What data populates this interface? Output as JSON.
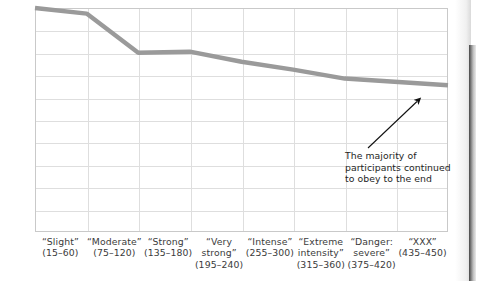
{
  "chart_data": {
    "type": "line",
    "title": "",
    "xlabel": "",
    "ylabel": "",
    "ylim": [
      0,
      100
    ],
    "ytick_values": [
      0,
      10,
      20,
      30,
      40,
      50,
      60,
      70,
      80,
      90,
      100
    ],
    "ytick_labels": [
      "0",
      "10",
      "20",
      "30",
      "40",
      "50",
      "60",
      "70",
      "80",
      "90",
      "100%"
    ],
    "grid": true,
    "legend": "none",
    "categories": [
      "“Slight”\n(15–60)",
      "“Moderate”\n(75–120)",
      "“Strong”\n(135–180)",
      "“Very\nstrong”\n(195–240)",
      "“Intense”\n(255–300)",
      "“Extreme\nintensity”\n(315–360)",
      "“Danger:\nsevere”\n(375–420)",
      "“XXX”\n(435–450)"
    ],
    "values": [
      100,
      97.5,
      80,
      80.5,
      76,
      72.5,
      68.5,
      65.5
    ],
    "series": [
      {
        "name": "Participants continuing",
        "values": [
          100,
          97.5,
          80,
          80.5,
          76,
          72.5,
          68.5,
          65.5
        ],
        "color": "#9a9a9a"
      }
    ],
    "annotations": [
      {
        "text": "The majority of participants continued to obey to the end",
        "lines": [
          "The majority of",
          "participants continued",
          "to obey to the end"
        ],
        "arrow": "points up-right to end of line"
      }
    ]
  },
  "axis": {
    "y": {
      "labels": [
        "100%",
        "90",
        "80",
        "70",
        "60",
        "50",
        "40",
        "30",
        "20",
        "10",
        "0"
      ]
    },
    "x": {
      "labels": [
        {
          "l1": "“Slight”",
          "l2": "(15–60)",
          "l3": ""
        },
        {
          "l1": "“Moderate”",
          "l2": "(75–120)",
          "l3": ""
        },
        {
          "l1": "“Strong”",
          "l2": "(135–180)",
          "l3": ""
        },
        {
          "l1": "“Very",
          "l2": "strong”",
          "l3": "(195–240)"
        },
        {
          "l1": "“Intense”",
          "l2": "(255–300)",
          "l3": ""
        },
        {
          "l1": "“Extreme",
          "l2": "intensity”",
          "l3": "(315–360)"
        },
        {
          "l1": "“Danger:",
          "l2": "severe”",
          "l3": "(375–420)"
        },
        {
          "l1": "“XXX”",
          "l2": "(435–450)",
          "l3": ""
        }
      ]
    }
  },
  "annotation": {
    "line1": "The majority of",
    "line2": "participants continued",
    "line3": "to obey to the end"
  },
  "colors": {
    "series": "#9a9a9a",
    "grid": "#dedede",
    "frame": "#c9c9c9",
    "text": "#3b3b3b",
    "annotation_text": "#1e1e1e",
    "arrow": "#111111"
  }
}
